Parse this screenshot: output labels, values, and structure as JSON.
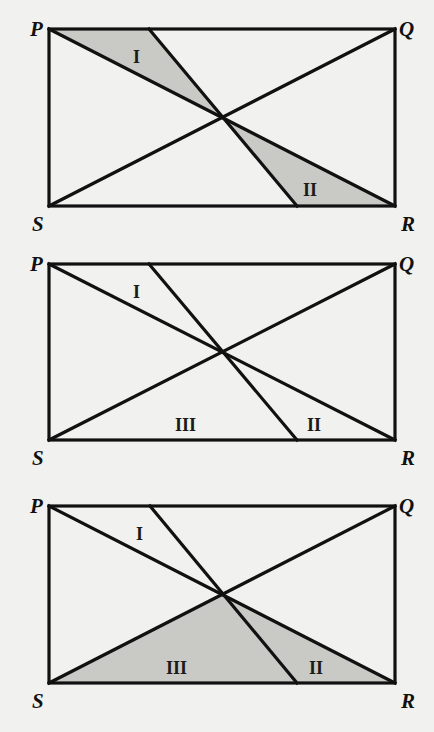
{
  "figure": {
    "colors": {
      "background": "#f1f1ef",
      "line": "#111111",
      "shade": "#c9c9c6"
    },
    "panels": [
      {
        "id": "panel-1",
        "vertices": {
          "P": "P",
          "Q": "Q",
          "R": "R",
          "S": "S"
        },
        "regions": [
          {
            "label": "I",
            "shaded": true
          },
          {
            "label": "II",
            "shaded": true
          }
        ]
      },
      {
        "id": "panel-2",
        "vertices": {
          "P": "P",
          "Q": "Q",
          "R": "R",
          "S": "S"
        },
        "regions": [
          {
            "label": "I",
            "shaded": false
          },
          {
            "label": "II",
            "shaded": false
          },
          {
            "label": "III",
            "shaded": false
          }
        ]
      },
      {
        "id": "panel-3",
        "vertices": {
          "P": "P",
          "Q": "Q",
          "R": "R",
          "S": "S"
        },
        "regions": [
          {
            "label": "I",
            "shaded": false
          },
          {
            "label": "II",
            "shaded": true
          },
          {
            "label": "III",
            "shaded": true
          }
        ]
      }
    ]
  }
}
